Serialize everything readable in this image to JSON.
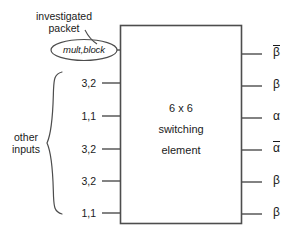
{
  "figure": {
    "title_block": {
      "line1": "6 x 6",
      "line2": "switching",
      "line3": "element"
    },
    "annotations": {
      "investigated_line1": "investigated",
      "investigated_line2": "packet",
      "other_inputs_line1": "other",
      "other_inputs_line2": "inputs"
    },
    "investigated_packet_label": "mult,block",
    "inputs": [
      {
        "label": "mult,block",
        "kind": "oval"
      },
      {
        "label": "3,2",
        "kind": "plain"
      },
      {
        "label": "1,1",
        "kind": "plain"
      },
      {
        "label": "3,2",
        "kind": "plain"
      },
      {
        "label": "3,2",
        "kind": "plain"
      },
      {
        "label": "1,1",
        "kind": "plain"
      }
    ],
    "outputs": [
      {
        "symbol": "β",
        "overbar": true
      },
      {
        "symbol": "β",
        "overbar": false
      },
      {
        "symbol": "α",
        "overbar": false
      },
      {
        "symbol": "α",
        "overbar": true
      },
      {
        "symbol": "β",
        "overbar": false
      },
      {
        "symbol": "β",
        "overbar": false
      }
    ],
    "colors": {
      "stroke": "#4d4d4d",
      "text": "#1a1a1a",
      "background": "#ffffff"
    }
  }
}
